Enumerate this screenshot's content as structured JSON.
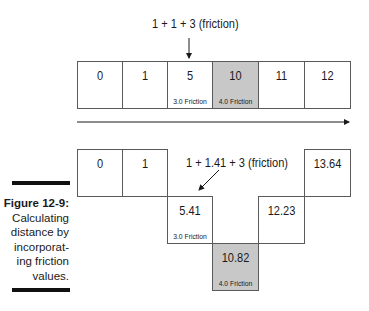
{
  "figure": {
    "title": "Figure 12-9:",
    "caption_lines": [
      "Calculating",
      "distance by",
      "incorporat-",
      "ing friction",
      "values."
    ]
  },
  "top_diagram": {
    "annotation": "1 + 1 + 3 (friction)",
    "cells": [
      {
        "value": "0",
        "friction": "",
        "shaded": false
      },
      {
        "value": "1",
        "friction": "",
        "shaded": false
      },
      {
        "value": "5",
        "friction": "3.0 Friction",
        "shaded": false
      },
      {
        "value": "10",
        "friction": "4.0 Friction",
        "shaded": true
      },
      {
        "value": "11",
        "friction": "",
        "shaded": false
      },
      {
        "value": "12",
        "friction": "",
        "shaded": false
      }
    ]
  },
  "bottom_diagram": {
    "annotation": "1 + 1.41 + 3 (friction)",
    "cells": [
      {
        "value": "0",
        "friction": "",
        "shaded": false
      },
      {
        "value": "1",
        "friction": "",
        "shaded": false
      },
      {
        "value": "13.64",
        "friction": "",
        "shaded": false
      },
      {
        "value": "5.41",
        "friction": "3.0 Friction",
        "shaded": false
      },
      {
        "value": "12.23",
        "friction": "",
        "shaded": false
      },
      {
        "value": "10.82",
        "friction": "4.0 Friction",
        "shaded": true
      }
    ]
  },
  "colors": {
    "shaded": "#c8c8c8",
    "border": "#5a5a5a",
    "text": "#1a1a1a"
  }
}
